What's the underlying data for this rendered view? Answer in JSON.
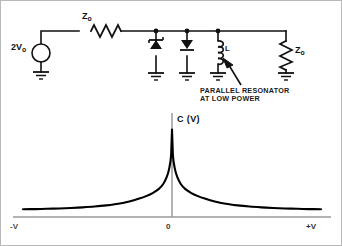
{
  "figure": {
    "title": "",
    "background": "#ffffff",
    "border_color": "#b8b8b8",
    "line_color": "#111111",
    "axis_color": "#9a9a9a",
    "curve_color": "#000000"
  },
  "circuit": {
    "source": {
      "label_main": "2V",
      "label_sub": "o",
      "symbol": "ac-voltage-source-circle"
    },
    "series_resistor": {
      "label_main": "Z",
      "label_sub": "o",
      "symbol": "resistor-zigzag"
    },
    "diode_1": {
      "symbol": "zener-diode-up",
      "label": ""
    },
    "diode_2": {
      "symbol": "diode-down",
      "label": ""
    },
    "inductor": {
      "symbol": "inductor-coil",
      "label": "L"
    },
    "load_resistor": {
      "label_main": "Z",
      "label_sub": "o",
      "symbol": "resistor-zigzag"
    },
    "ground_symbol": "ground",
    "annotation": {
      "line_1": "PARALLEL RESONATOR",
      "line_2": "AT LOW POWER",
      "pointer": "arrow-to-inductor"
    }
  },
  "chart_data": {
    "type": "line",
    "title": "",
    "ylabel": "C (V)",
    "xlabel": "",
    "x_tick_labels": [
      "-V",
      "0",
      "+V"
    ],
    "x_tick_positions": [
      -1,
      0,
      1
    ],
    "xlim": [
      -1,
      1
    ],
    "ylim": [
      0,
      1
    ],
    "grid": false,
    "legend": null,
    "annotation": "Sharp cusp peak in capacitance at V = 0, symmetric exponential decay toward both -V and +V",
    "series": [
      {
        "name": "C(V)",
        "x": [
          -1.0,
          -0.92,
          -0.84,
          -0.76,
          -0.68,
          -0.6,
          -0.52,
          -0.44,
          -0.36,
          -0.28,
          -0.22,
          -0.17,
          -0.13,
          -0.09,
          -0.06,
          -0.035,
          -0.018,
          -0.006,
          0.0,
          0.006,
          0.018,
          0.035,
          0.06,
          0.09,
          0.13,
          0.17,
          0.22,
          0.28,
          0.36,
          0.44,
          0.52,
          0.6,
          0.68,
          0.76,
          0.84,
          0.92,
          1.0
        ],
        "y": [
          0.085,
          0.087,
          0.09,
          0.094,
          0.099,
          0.106,
          0.115,
          0.128,
          0.146,
          0.174,
          0.202,
          0.232,
          0.263,
          0.306,
          0.36,
          0.44,
          0.54,
          0.68,
          0.96,
          0.68,
          0.54,
          0.44,
          0.36,
          0.306,
          0.263,
          0.232,
          0.202,
          0.174,
          0.146,
          0.128,
          0.115,
          0.106,
          0.099,
          0.094,
          0.09,
          0.087,
          0.085
        ]
      }
    ]
  }
}
